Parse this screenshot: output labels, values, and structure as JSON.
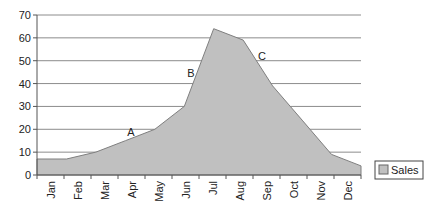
{
  "chart_data": {
    "type": "area",
    "title": "",
    "xlabel": "",
    "ylabel": "",
    "categories": [
      "Jan",
      "Feb",
      "Mar",
      "Apr",
      "May",
      "Jun",
      "Jul",
      "Aug",
      "Sep",
      "Oct",
      "Nov",
      "Dec"
    ],
    "series": [
      {
        "name": "Sales",
        "values": [
          7,
          7,
          10,
          15,
          20,
          30,
          64,
          59,
          39,
          24,
          9,
          4
        ]
      }
    ],
    "ylim": [
      0,
      70
    ],
    "yticks": [
      0,
      10,
      20,
      30,
      40,
      50,
      60,
      70
    ],
    "grid": true,
    "legend_position": "right",
    "annotations": [
      {
        "text": "A",
        "x_index": 3,
        "y": 17
      },
      {
        "text": "B",
        "x_index": 5,
        "y": 44
      },
      {
        "text": "C",
        "x_index": 7,
        "y": 51
      }
    ],
    "colors": {
      "fill": "#c0c0c0",
      "line": "#7f7f7f",
      "grid": "#8c8c8c",
      "axis": "#555555"
    }
  }
}
